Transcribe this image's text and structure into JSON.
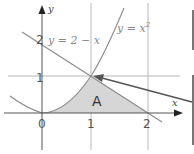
{
  "diagram": {
    "axes": {
      "x_label": "x",
      "y_label": "y"
    },
    "tick_labels": {
      "origin": "0",
      "x1": "1",
      "x2": "2",
      "y1": "1",
      "y2": "2"
    },
    "curves": [
      {
        "name": "parabola",
        "label_main": "y = x",
        "label_sup": "2"
      },
      {
        "name": "line",
        "label": "y = 2 − x"
      }
    ],
    "region": {
      "label": "A",
      "fill": "#d6d6d6"
    },
    "intersection_point": {
      "x": 1,
      "y": 1
    },
    "colors": {
      "grid": "#b0b0b0",
      "curve": "#8a8a8a",
      "axis": "#555555",
      "arrow": "#555555",
      "box_border": "#777777"
    }
  }
}
